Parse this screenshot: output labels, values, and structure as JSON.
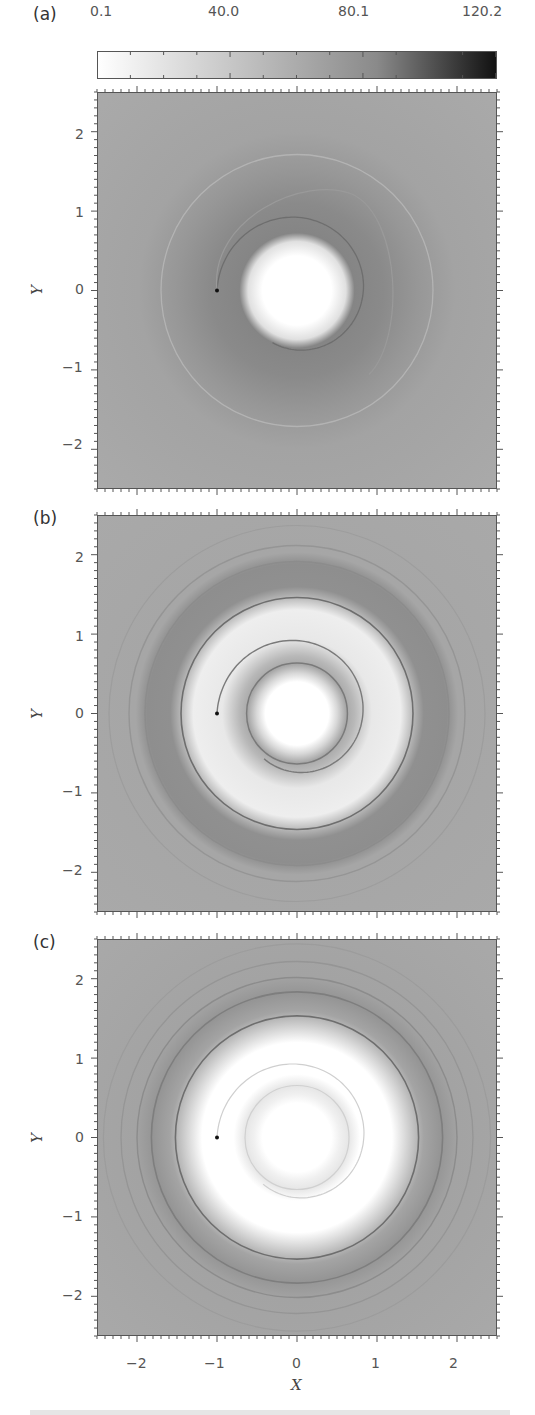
{
  "colorbar": {
    "labels": [
      "0.1",
      "40.0",
      "80.1",
      "120.2"
    ],
    "min": 0.1,
    "max": 120.2,
    "color_low": "#ffffff",
    "color_high": "#111111"
  },
  "panels": [
    {
      "label": "(a)",
      "y_title": "Y"
    },
    {
      "label": "(b)",
      "y_title": "Y"
    },
    {
      "label": "(c)",
      "y_title": "Y"
    }
  ],
  "x_axis": {
    "title": "X",
    "ticks": [
      "−2",
      "−1",
      "0",
      "1",
      "2"
    ]
  },
  "y_axis": {
    "ticks": [
      "2",
      "1",
      "0",
      "−1",
      "−2"
    ]
  },
  "chart_data": [
    {
      "type": "heatmap",
      "title": "(a)",
      "xlabel": "X",
      "ylabel": "Y",
      "xlim": [
        -2.5,
        2.5
      ],
      "ylim": [
        -2.5,
        2.5
      ],
      "xticks": [
        -2,
        -1,
        0,
        1,
        2
      ],
      "yticks": [
        -2,
        -1,
        0,
        1,
        2
      ],
      "colorbar": {
        "min": 0.1,
        "max": 120.2,
        "ticks": [
          0.1,
          40.0,
          80.1,
          120.2
        ],
        "colormap": "white-to-black"
      },
      "features": {
        "background_level": "mid-grey",
        "central_white_disc_radius": 0.5,
        "dark_halo_radius": [
          0.5,
          1.1
        ],
        "spiral_arm": "single thin dark arm from point (-1, 0) wrapping around center to radius ~1.3",
        "faint_outer_ring_radius": 1.7,
        "point_source": [
          -1.0,
          0.0
        ]
      }
    },
    {
      "type": "heatmap",
      "title": "(b)",
      "xlabel": "X",
      "ylabel": "Y",
      "xlim": [
        -2.5,
        2.5
      ],
      "ylim": [
        -2.5,
        2.5
      ],
      "xticks": [
        -2,
        -1,
        0,
        1,
        2
      ],
      "yticks": [
        -2,
        -1,
        0,
        1,
        2
      ],
      "features": {
        "central_white_disc_radius": 0.45,
        "inner_dark_ring_radius": 0.65,
        "light_band_radius": [
          0.9,
          1.4
        ],
        "dark_ring_radius": 1.55,
        "outer_ripple_rings_radii": [
          1.9,
          2.1,
          2.35
        ],
        "point_source": [
          -1.0,
          0.0
        ]
      }
    },
    {
      "type": "heatmap",
      "title": "(c)",
      "xlabel": "X",
      "ylabel": "Y",
      "xlim": [
        -2.5,
        2.5
      ],
      "ylim": [
        -2.5,
        2.5
      ],
      "xticks": [
        -2,
        -1,
        0,
        1,
        2
      ],
      "yticks": [
        -2,
        -1,
        0,
        1,
        2
      ],
      "features": {
        "central_white_disc_radius": 0.5,
        "faint_inner_ring_radius": 0.65,
        "white_band_radius": [
          0.8,
          1.25
        ],
        "dark_ring_radius": 1.65,
        "outer_ripple_rings_radii": [
          1.9,
          2.1,
          2.3,
          2.45
        ],
        "point_source": [
          -1.0,
          0.0
        ]
      }
    }
  ]
}
